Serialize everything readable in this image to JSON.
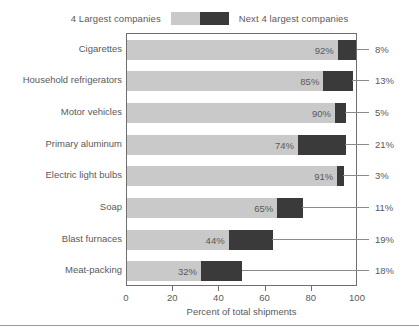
{
  "legend": {
    "left_label": "4 Largest companies",
    "right_label": "Next 4 largest companies",
    "light_color": "#c9c9c9",
    "dark_color": "#3a3a3a"
  },
  "axis": {
    "x_title": "Percent of total shipments",
    "ticks": [
      "0",
      "20",
      "40",
      "60",
      "80",
      "100"
    ]
  },
  "chart_data": {
    "type": "bar",
    "orientation": "horizontal",
    "stacked": true,
    "title": "",
    "xlabel": "Percent of total shipments",
    "ylabel": "",
    "xlim": [
      0,
      100
    ],
    "xticks": [
      0,
      20,
      40,
      60,
      80,
      100
    ],
    "grid": false,
    "legend_position": "top-center",
    "categories": [
      "Cigarettes",
      "Household refrigerators",
      "Motor vehicles",
      "Primary aluminum",
      "Electric light bulbs",
      "Soap",
      "Blast furnaces",
      "Meat-packing"
    ],
    "series": [
      {
        "name": "4 Largest companies",
        "color": "#c9c9c9",
        "values": [
          92,
          85,
          90,
          74,
          91,
          65,
          44,
          32
        ],
        "labels": [
          "92%",
          "85%",
          "90%",
          "74%",
          "91%",
          "65%",
          "44%",
          "32%"
        ]
      },
      {
        "name": "Next 4 largest companies",
        "color": "#3a3a3a",
        "values": [
          8,
          13,
          5,
          21,
          3,
          11,
          19,
          18
        ],
        "labels": [
          "8%",
          "13%",
          "5%",
          "21%",
          "3%",
          "11%",
          "19%",
          "18%"
        ]
      }
    ]
  }
}
